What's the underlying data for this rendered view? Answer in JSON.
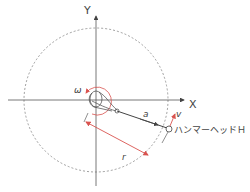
{
  "diagram": {
    "axes": {
      "x_label": "X",
      "y_label": "Y"
    },
    "labels": {
      "omega": "ω",
      "a": "a",
      "v": "v",
      "r": "r",
      "hammer_head": "ハンマーヘッドＨ"
    },
    "colors": {
      "line": "#555555",
      "accent": "#d9534f",
      "circle": "#777777",
      "text": "#444444"
    }
  }
}
